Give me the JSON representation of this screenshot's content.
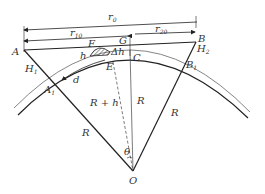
{
  "diagram": {
    "labels": {
      "A": "A",
      "B": "B",
      "C": "C",
      "E": "E",
      "F": "F",
      "G": "G",
      "O": "O",
      "A1_base": "A",
      "A1_sub": "1",
      "B1_base": "B",
      "B1_sub": "1",
      "H1_base": "H",
      "H1_sub": "1",
      "H2_base": "H",
      "H2_sub": "2",
      "r0_base": "r",
      "r0_sub": "0",
      "r10_base": "r",
      "r10_sub": "10",
      "r20_base": "r",
      "r20_sub": "20",
      "h": "h",
      "delta_h": "Δh",
      "d": "d",
      "R_plus_h": "R + h",
      "R_left": "R",
      "R_mid": "R",
      "R_right": "R",
      "theta": "θ"
    },
    "colors": {
      "line": "#222222",
      "hatch": "#333333",
      "text": "#333333"
    }
  }
}
